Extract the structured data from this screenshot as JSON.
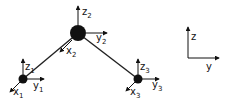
{
  "diagram": {
    "colors": {
      "ink": "#111111",
      "background": "#ffffff"
    },
    "nodes": [
      {
        "id": "node-1",
        "cx": 23,
        "cy": 79,
        "r": 4.5,
        "axes": {
          "z": "z",
          "z_sub": "1",
          "y": "y",
          "y_sub": "1",
          "x": "x",
          "x_sub": "1"
        }
      },
      {
        "id": "node-2",
        "cx": 78,
        "cy": 33,
        "r": 8,
        "axes": {
          "z": "z",
          "z_sub": "2",
          "y": "y",
          "y_sub": "2",
          "x": "x",
          "x_sub": "2"
        }
      },
      {
        "id": "node-3",
        "cx": 138,
        "cy": 79,
        "r": 4.5,
        "axes": {
          "z": "z",
          "z_sub": "3",
          "y": "y",
          "y_sub": "3",
          "x": "x",
          "x_sub": "3"
        }
      }
    ],
    "links": [
      {
        "from": "node-1",
        "to": "node-2"
      },
      {
        "from": "node-2",
        "to": "node-3"
      }
    ],
    "reference_frame": {
      "z_label": "z",
      "y_label": "y"
    }
  }
}
